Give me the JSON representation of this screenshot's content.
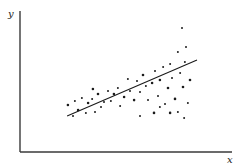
{
  "chart_data": {
    "type": "scatter",
    "title": "",
    "xlabel": "x",
    "ylabel": "y",
    "grid": false,
    "legend": null,
    "axis_ticks": "none",
    "xlim": [
      0,
      100
    ],
    "ylim": [
      0,
      100
    ],
    "plot_area_px": {
      "left": 20,
      "right": 232,
      "top": 12,
      "bottom": 152
    },
    "points": [
      {
        "x": 22.6,
        "y": 33.6
      },
      {
        "x": 25.9,
        "y": 36.4
      },
      {
        "x": 25.0,
        "y": 25.7
      },
      {
        "x": 27.4,
        "y": 30.0
      },
      {
        "x": 29.2,
        "y": 38.6
      },
      {
        "x": 31.1,
        "y": 27.9
      },
      {
        "x": 32.1,
        "y": 35.0
      },
      {
        "x": 34.0,
        "y": 37.9
      },
      {
        "x": 35.4,
        "y": 28.6
      },
      {
        "x": 36.8,
        "y": 41.4
      },
      {
        "x": 38.2,
        "y": 32.1
      },
      {
        "x": 39.6,
        "y": 35.7
      },
      {
        "x": 34.4,
        "y": 45.0
      },
      {
        "x": 41.5,
        "y": 43.6
      },
      {
        "x": 42.9,
        "y": 36.4
      },
      {
        "x": 44.3,
        "y": 41.4
      },
      {
        "x": 46.2,
        "y": 45.7
      },
      {
        "x": 47.2,
        "y": 32.9
      },
      {
        "x": 49.1,
        "y": 39.3
      },
      {
        "x": 50.9,
        "y": 52.1
      },
      {
        "x": 51.9,
        "y": 43.6
      },
      {
        "x": 53.8,
        "y": 37.1
      },
      {
        "x": 55.2,
        "y": 50.7
      },
      {
        "x": 56.6,
        "y": 42.9
      },
      {
        "x": 58.0,
        "y": 55.0
      },
      {
        "x": 59.4,
        "y": 47.1
      },
      {
        "x": 60.4,
        "y": 37.1
      },
      {
        "x": 62.3,
        "y": 49.3
      },
      {
        "x": 63.7,
        "y": 57.9
      },
      {
        "x": 65.1,
        "y": 40.0
      },
      {
        "x": 66.0,
        "y": 51.4
      },
      {
        "x": 67.5,
        "y": 60.7
      },
      {
        "x": 68.4,
        "y": 34.3
      },
      {
        "x": 69.8,
        "y": 45.7
      },
      {
        "x": 70.8,
        "y": 62.9
      },
      {
        "x": 71.7,
        "y": 52.9
      },
      {
        "x": 73.1,
        "y": 37.9
      },
      {
        "x": 74.5,
        "y": 71.4
      },
      {
        "x": 75.5,
        "y": 56.4
      },
      {
        "x": 76.9,
        "y": 46.4
      },
      {
        "x": 77.8,
        "y": 64.3
      },
      {
        "x": 79.2,
        "y": 35.0
      },
      {
        "x": 80.2,
        "y": 51.4
      },
      {
        "x": 76.4,
        "y": 88.6
      },
      {
        "x": 78.3,
        "y": 75.0
      },
      {
        "x": 70.8,
        "y": 27.9
      },
      {
        "x": 74.5,
        "y": 28.6
      },
      {
        "x": 77.4,
        "y": 24.3
      },
      {
        "x": 63.2,
        "y": 27.9
      },
      {
        "x": 66.0,
        "y": 32.1
      },
      {
        "x": 56.6,
        "y": 25.7
      }
    ],
    "fit_line": {
      "x": [
        22.2,
        83.5
      ],
      "y": [
        25.7,
        65.7
      ]
    }
  },
  "labels": {
    "y_axis": "y",
    "x_axis": "x"
  },
  "colors": {
    "dots": "#1b1b1b",
    "axes": "#3a3a3a",
    "fit_line": "#1a1a1a"
  }
}
